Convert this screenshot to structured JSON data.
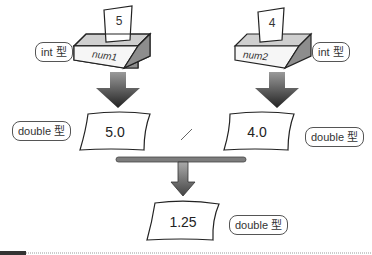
{
  "variables": [
    {
      "name": "num1",
      "value": "5",
      "type_label": "int 型"
    },
    {
      "name": "num2",
      "value": "4",
      "type_label": "int 型"
    }
  ],
  "casted": [
    {
      "value": "5.0",
      "type_label": "double 型"
    },
    {
      "value": "4.0",
      "type_label": "double 型"
    }
  ],
  "operator": "/",
  "result": {
    "value": "1.25",
    "type_label": "double 型"
  },
  "colors": {
    "outline": "#222222",
    "arrow_dark": "#333333",
    "arrow_light": "#888888",
    "bar": "#7a7a7a",
    "box_side": "#9a9a9a",
    "box_top": "#d8d8d8"
  }
}
